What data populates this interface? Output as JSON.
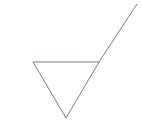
{
  "figure": {
    "background_color": "#ffffff",
    "stroke_color": "#7a7a7a",
    "stroke_width": 1,
    "canvas": {
      "width": 142,
      "height": 135
    },
    "watermark": {
      "text": "watermark",
      "color": "#fbfbfb",
      "visible": "faint"
    },
    "shapes": [
      {
        "name": "downward-triangle",
        "type": "polygon",
        "closed": true,
        "vertices": [
          {
            "label": "left-vertex",
            "x": 33,
            "y": 62
          },
          {
            "label": "right-vertex",
            "x": 99,
            "y": 62
          },
          {
            "label": "bottom-vertex",
            "x": 66,
            "y": 118
          }
        ],
        "edges": [
          {
            "label": "top-edge",
            "from": "left-vertex",
            "to": "right-vertex"
          },
          {
            "label": "right-edge",
            "from": "right-vertex",
            "to": "bottom-vertex"
          },
          {
            "label": "left-edge",
            "from": "bottom-vertex",
            "to": "left-vertex"
          }
        ]
      },
      {
        "name": "diagonal-ray",
        "type": "line",
        "from": {
          "label": "ray-start",
          "x": 99,
          "y": 62
        },
        "to": {
          "label": "ray-end",
          "x": 137,
          "y": 4
        }
      }
    ]
  }
}
